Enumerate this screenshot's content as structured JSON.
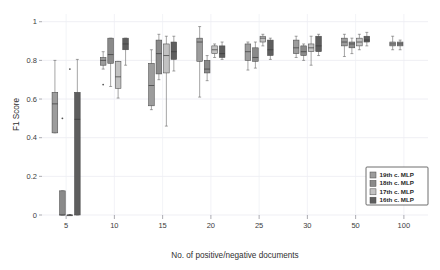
{
  "chart_data": {
    "type": "box",
    "title": "",
    "xlabel": "No. of positive/negative documents",
    "ylabel": "F1 Score",
    "categories": [
      "5",
      "10",
      "15",
      "20",
      "25",
      "30",
      "50",
      "100"
    ],
    "ylim": [
      0,
      1.04
    ],
    "yticks": [
      0,
      0.2,
      0.4,
      0.6,
      0.8,
      1
    ],
    "ytick_labels": [
      "0",
      "0.2",
      "0.4",
      "0.6",
      "0.8",
      "1"
    ],
    "grid": "horizontal-and-vertical",
    "legend_position": "bottom-right",
    "series": [
      {
        "name": "19th c. MLP",
        "color": "#9c9c9c",
        "boxes": [
          {
            "category": "5",
            "min": 0.425,
            "q1": 0.425,
            "median": 0.575,
            "q3": 0.635,
            "max": 0.8,
            "outliers": []
          },
          {
            "category": "10",
            "min": 0.755,
            "q1": 0.775,
            "median": 0.8,
            "q3": 0.815,
            "max": 0.845,
            "outliers": [
              0.675
            ]
          },
          {
            "category": "15",
            "min": 0.545,
            "q1": 0.565,
            "median": 0.67,
            "q3": 0.785,
            "max": 0.855,
            "outliers": []
          },
          {
            "category": "20",
            "min": 0.61,
            "q1": 0.795,
            "median": 0.895,
            "q3": 0.915,
            "max": 0.975,
            "outliers": []
          },
          {
            "category": "25",
            "min": 0.75,
            "q1": 0.8,
            "median": 0.845,
            "q3": 0.885,
            "max": 0.895,
            "outliers": []
          },
          {
            "category": "30",
            "min": 0.815,
            "q1": 0.835,
            "median": 0.865,
            "q3": 0.905,
            "max": 0.925,
            "outliers": []
          },
          {
            "category": "50",
            "min": 0.82,
            "q1": 0.875,
            "median": 0.895,
            "q3": 0.915,
            "max": 0.935,
            "outliers": []
          },
          {
            "category": "100",
            "min": 0.855,
            "q1": 0.875,
            "median": 0.885,
            "q3": 0.895,
            "max": 0.925,
            "outliers": []
          }
        ]
      },
      {
        "name": "18th c. MLP",
        "color": "#8a8a8a",
        "boxes": [
          {
            "category": "5",
            "min": 0.0,
            "q1": 0.0,
            "median": 0.0,
            "q3": 0.125,
            "max": 0.125,
            "outliers": [
              0.5
            ]
          },
          {
            "category": "10",
            "min": 0.665,
            "q1": 0.785,
            "median": 0.83,
            "q3": 0.915,
            "max": 0.915,
            "outliers": []
          },
          {
            "category": "15",
            "min": 0.7,
            "q1": 0.73,
            "median": 0.835,
            "q3": 0.905,
            "max": 0.935,
            "outliers": []
          },
          {
            "category": "20",
            "min": 0.695,
            "q1": 0.735,
            "median": 0.755,
            "q3": 0.8,
            "max": 0.825,
            "outliers": []
          },
          {
            "category": "25",
            "min": 0.76,
            "q1": 0.795,
            "median": 0.815,
            "q3": 0.865,
            "max": 0.895,
            "outliers": []
          },
          {
            "category": "30",
            "min": 0.8,
            "q1": 0.825,
            "median": 0.845,
            "q3": 0.875,
            "max": 0.885,
            "outliers": []
          },
          {
            "category": "50",
            "min": 0.835,
            "q1": 0.865,
            "median": 0.885,
            "q3": 0.895,
            "max": 0.915,
            "outliers": []
          },
          {
            "category": "100",
            "min": 0.855,
            "q1": 0.875,
            "median": 0.885,
            "q3": 0.895,
            "max": 0.905,
            "outliers": []
          }
        ]
      },
      {
        "name": "17th c. MLP",
        "color": "#c2c2c2",
        "boxes": [
          {
            "category": "5",
            "min": 0.0,
            "q1": 0.0,
            "median": 0.0,
            "q3": 0.0,
            "max": 0.0,
            "outliers": [
              0.0,
              0.755
            ]
          },
          {
            "category": "10",
            "min": 0.605,
            "q1": 0.655,
            "median": 0.715,
            "q3": 0.795,
            "max": 0.795,
            "outliers": []
          },
          {
            "category": "15",
            "min": 0.46,
            "q1": 0.735,
            "median": 0.825,
            "q3": 0.885,
            "max": 0.925,
            "outliers": []
          },
          {
            "category": "20",
            "min": 0.815,
            "q1": 0.835,
            "median": 0.855,
            "q3": 0.875,
            "max": 0.885,
            "outliers": []
          },
          {
            "category": "25",
            "min": 0.875,
            "q1": 0.895,
            "median": 0.915,
            "q3": 0.925,
            "max": 0.935,
            "outliers": []
          },
          {
            "category": "30",
            "min": 0.775,
            "q1": 0.845,
            "median": 0.865,
            "q3": 0.885,
            "max": 0.925,
            "outliers": []
          },
          {
            "category": "50",
            "min": 0.855,
            "q1": 0.875,
            "median": 0.895,
            "q3": 0.915,
            "max": 0.935,
            "outliers": []
          },
          {
            "category": "100",
            "min": null,
            "q1": null,
            "median": null,
            "q3": null,
            "max": null,
            "outliers": []
          }
        ]
      },
      {
        "name": "16th c. MLP",
        "color": "#5e5e5e",
        "boxes": [
          {
            "category": "5",
            "min": 0.0,
            "q1": 0.0,
            "median": 0.495,
            "q3": 0.635,
            "max": 0.805,
            "outliers": []
          },
          {
            "category": "10",
            "min": 0.775,
            "q1": 0.855,
            "median": 0.885,
            "q3": 0.915,
            "max": 0.915,
            "outliers": []
          },
          {
            "category": "15",
            "min": 0.745,
            "q1": 0.805,
            "median": 0.845,
            "q3": 0.895,
            "max": 0.925,
            "outliers": []
          },
          {
            "category": "20",
            "min": 0.805,
            "q1": 0.815,
            "median": 0.835,
            "q3": 0.875,
            "max": 0.895,
            "outliers": []
          },
          {
            "category": "25",
            "min": 0.805,
            "q1": 0.825,
            "median": 0.855,
            "q3": 0.905,
            "max": 0.915,
            "outliers": []
          },
          {
            "category": "30",
            "min": 0.825,
            "q1": 0.845,
            "median": 0.875,
            "q3": 0.925,
            "max": 0.935,
            "outliers": []
          },
          {
            "category": "50",
            "min": 0.875,
            "q1": 0.895,
            "median": 0.905,
            "q3": 0.925,
            "max": 0.945,
            "outliers": []
          },
          {
            "category": "100",
            "min": null,
            "q1": null,
            "median": null,
            "q3": null,
            "max": null,
            "outliers": []
          }
        ]
      }
    ]
  },
  "axes": {
    "y_title": "F1 Score",
    "x_title": "No. of positive/negative documents",
    "y_tick_labels": [
      "0",
      "0.2",
      "0.4",
      "0.6",
      "0.8",
      "1"
    ],
    "x_tick_labels": [
      "5",
      "10",
      "15",
      "20",
      "25",
      "30",
      "50",
      "100"
    ]
  },
  "legend": {
    "items": [
      {
        "label": "19th c. MLP",
        "color": "#9c9c9c"
      },
      {
        "label": "18th c. MLP",
        "color": "#8a8a8a"
      },
      {
        "label": "17th c. MLP",
        "color": "#c2c2c2"
      },
      {
        "label": "16th c. MLP",
        "color": "#5e5e5e"
      }
    ]
  },
  "colors": {
    "background": "#ffffff",
    "grid": "#e8e8ef",
    "axis_text": "#3c3c3c",
    "box_stroke": "#4a4a4a"
  }
}
